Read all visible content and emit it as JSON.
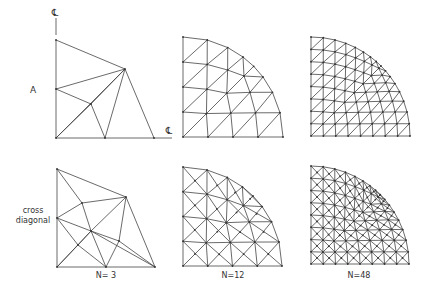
{
  "figure": {
    "row_labels": [
      {
        "id": "A",
        "lines": [
          "A"
        ],
        "x": 33,
        "y": 92
      },
      {
        "id": "cross-diagonal",
        "lines": [
          "cross",
          "diagonal"
        ],
        "x": 33,
        "y": 215
      }
    ],
    "column_labels": [
      {
        "text": "N= 3",
        "x": 106,
        "y": 278
      },
      {
        "text": "N=12",
        "x": 233,
        "y": 278
      },
      {
        "text": "N=48",
        "x": 359,
        "y": 278
      }
    ],
    "centerline_symbol": "℄",
    "centerline_marks": [
      {
        "x": 55,
        "y": 14,
        "line": [
          56,
          18,
          56,
          35
        ]
      },
      {
        "x": 169,
        "y": 132,
        "line": [
          154,
          138,
          172,
          138
        ]
      }
    ],
    "panels": [
      {
        "id": "A-N3",
        "pattern": "A",
        "N": 3,
        "nodes": [
          [
            56,
            40
          ],
          [
            125,
            69
          ],
          [
            56,
            89
          ],
          [
            91,
            104
          ],
          [
            105,
            138
          ],
          [
            154,
            138
          ],
          [
            56,
            138
          ]
        ],
        "edges": [
          [
            0,
            1
          ],
          [
            1,
            5
          ],
          [
            5,
            4
          ],
          [
            4,
            6
          ],
          [
            6,
            2
          ],
          [
            2,
            0
          ],
          [
            2,
            1
          ],
          [
            2,
            3
          ],
          [
            3,
            1
          ],
          [
            3,
            4
          ],
          [
            3,
            6
          ],
          [
            1,
            4
          ],
          [
            6,
            1
          ]
        ]
      },
      {
        "id": "A-N12",
        "pattern": "A",
        "N": 12,
        "origin": [
          183,
          137
        ],
        "radius": 100,
        "top_flat": true,
        "divisions": 4
      },
      {
        "id": "A-N48",
        "pattern": "A",
        "N": 48,
        "origin": [
          311,
          136
        ],
        "radius": 99,
        "divisions": 8
      },
      {
        "id": "CD-N3",
        "pattern": "cross-diagonal",
        "N": 3,
        "nodes": [
          [
            57,
            169
          ],
          [
            126,
            197
          ],
          [
            57,
            218
          ],
          [
            82,
            203
          ],
          [
            91,
            231
          ],
          [
            119,
            241
          ],
          [
            78,
            245
          ],
          [
            57,
            267
          ],
          [
            106,
            267
          ],
          [
            155,
            267
          ]
        ],
        "edges": [
          [
            0,
            1
          ],
          [
            1,
            9
          ],
          [
            9,
            8
          ],
          [
            8,
            7
          ],
          [
            7,
            2
          ],
          [
            2,
            0
          ],
          [
            0,
            3
          ],
          [
            3,
            1
          ],
          [
            2,
            3
          ],
          [
            3,
            4
          ],
          [
            4,
            8
          ],
          [
            2,
            4
          ],
          [
            4,
            5
          ],
          [
            5,
            9
          ],
          [
            1,
            5
          ],
          [
            5,
            8
          ],
          [
            1,
            4
          ],
          [
            2,
            6
          ],
          [
            6,
            8
          ],
          [
            7,
            6
          ],
          [
            6,
            4
          ],
          [
            7,
            4
          ],
          [
            4,
            9
          ]
        ]
      },
      {
        "id": "CD-N12",
        "pattern": "cross-diagonal",
        "N": 12,
        "origin": [
          183,
          266
        ],
        "radius": 99,
        "divisions": 4
      },
      {
        "id": "CD-N48",
        "pattern": "cross-diagonal",
        "N": 48,
        "origin": [
          311,
          264
        ],
        "radius": 98,
        "divisions": 8
      }
    ]
  }
}
